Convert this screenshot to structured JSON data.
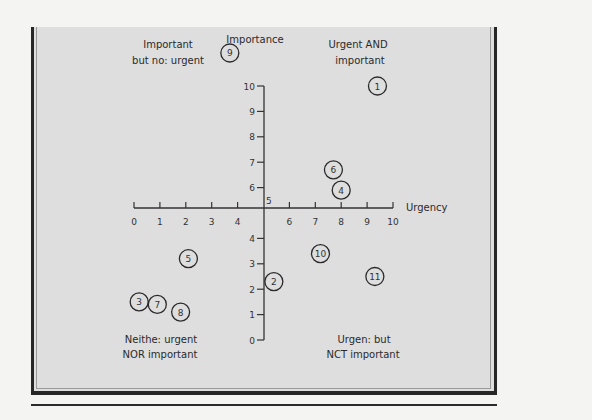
{
  "chart_data": {
    "type": "scatter",
    "title": "",
    "xlabel": "Urgency",
    "ylabel": "Importance",
    "xlim": [
      0,
      10
    ],
    "ylim": [
      0,
      10
    ],
    "axis_crossing": {
      "x": 5,
      "y": 5,
      "label": "5"
    },
    "x_ticks": [
      "0",
      "1",
      "2",
      "3",
      "4",
      "6",
      "7",
      "8",
      "9",
      "10"
    ],
    "y_ticks": [
      "0",
      "1",
      "2",
      "3",
      "4",
      "6",
      "7",
      "8",
      "9",
      "10"
    ],
    "quadrant_labels": {
      "top_left": [
        "Important",
        "but no: urgent"
      ],
      "top_right": [
        "Urgent AND",
        "important"
      ],
      "bottom_left": [
        "Neithe: urgent",
        "NOR important"
      ],
      "bottom_right": [
        "Urgen: but",
        "NCT important"
      ]
    },
    "points": [
      {
        "label": "1",
        "x": 9.4,
        "y": 10.0
      },
      {
        "label": "2",
        "x": 5.4,
        "y": 2.3
      },
      {
        "label": "3",
        "x": 0.2,
        "y": 1.5
      },
      {
        "label": "4",
        "x": 8.0,
        "y": 5.9
      },
      {
        "label": "5",
        "x": 2.1,
        "y": 3.2
      },
      {
        "label": "6",
        "x": 7.7,
        "y": 6.7
      },
      {
        "label": "7",
        "x": 0.9,
        "y": 1.4
      },
      {
        "label": "8",
        "x": 1.8,
        "y": 1.1
      },
      {
        "label": "9",
        "x": 3.7,
        "y": 11.3
      },
      {
        "label": "10",
        "x": 7.2,
        "y": 3.4
      },
      {
        "label": "11",
        "x": 9.3,
        "y": 2.5
      }
    ],
    "grid": false,
    "legend": "none"
  }
}
